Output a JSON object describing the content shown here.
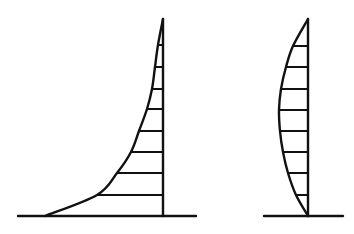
{
  "figure": {
    "stroke_color": "#111111",
    "background_color": "#ffffff",
    "left_profile": {
      "shape": "concave curve (parabolic-like) rising from baseline to top of vertical axis",
      "axis_x": 163,
      "axis_top_y": 19,
      "baseline_y": 216,
      "baseline_x_range": [
        18,
        196
      ],
      "curve_points": [
        [
          45,
          216
        ],
        [
          97,
          195
        ],
        [
          117,
          173
        ],
        [
          131,
          152
        ],
        [
          139,
          131
        ],
        [
          147,
          109
        ],
        [
          152,
          89
        ],
        [
          155,
          67
        ],
        [
          158,
          45
        ],
        [
          163,
          19
        ]
      ],
      "rungs": [
        {
          "y": 45,
          "x_start": 158
        },
        {
          "y": 67,
          "x_start": 155
        },
        {
          "y": 89,
          "x_start": 152
        },
        {
          "y": 109,
          "x_start": 147
        },
        {
          "y": 131,
          "x_start": 139
        },
        {
          "y": 152,
          "x_start": 131
        },
        {
          "y": 173,
          "x_start": 117
        },
        {
          "y": 195,
          "x_start": 97
        }
      ]
    },
    "right_profile": {
      "shape": "convex bulge (arc) connecting top and bottom of vertical axis",
      "axis_x": 308,
      "axis_top_y": 19,
      "baseline_y": 216,
      "baseline_x_range": [
        264,
        343
      ],
      "curve_points": [
        [
          308,
          19
        ],
        [
          293,
          46
        ],
        [
          286,
          67
        ],
        [
          281,
          89
        ],
        [
          279,
          110
        ],
        [
          280,
          131
        ],
        [
          283,
          152
        ],
        [
          288,
          173
        ],
        [
          296,
          195
        ],
        [
          308,
          216
        ]
      ],
      "rungs": [
        {
          "y": 46,
          "x_start": 293
        },
        {
          "y": 67,
          "x_start": 286
        },
        {
          "y": 89,
          "x_start": 281
        },
        {
          "y": 110,
          "x_start": 279
        },
        {
          "y": 131,
          "x_start": 280
        },
        {
          "y": 152,
          "x_start": 283
        },
        {
          "y": 173,
          "x_start": 288
        },
        {
          "y": 195,
          "x_start": 296
        }
      ]
    }
  }
}
